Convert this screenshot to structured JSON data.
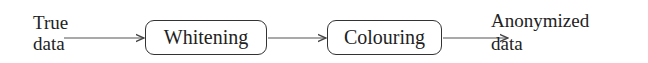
{
  "diagram": {
    "type": "pipeline",
    "input": {
      "line1": "True",
      "line2": "data"
    },
    "steps": [
      {
        "label": "Whitening"
      },
      {
        "label": "Colouring"
      }
    ],
    "output": {
      "line1": "Anonymized",
      "line2": "data"
    },
    "edges": [
      {
        "from": "True data",
        "to": "Whitening"
      },
      {
        "from": "Whitening",
        "to": "Colouring"
      },
      {
        "from": "Colouring",
        "to": "Anonymized data"
      }
    ]
  }
}
